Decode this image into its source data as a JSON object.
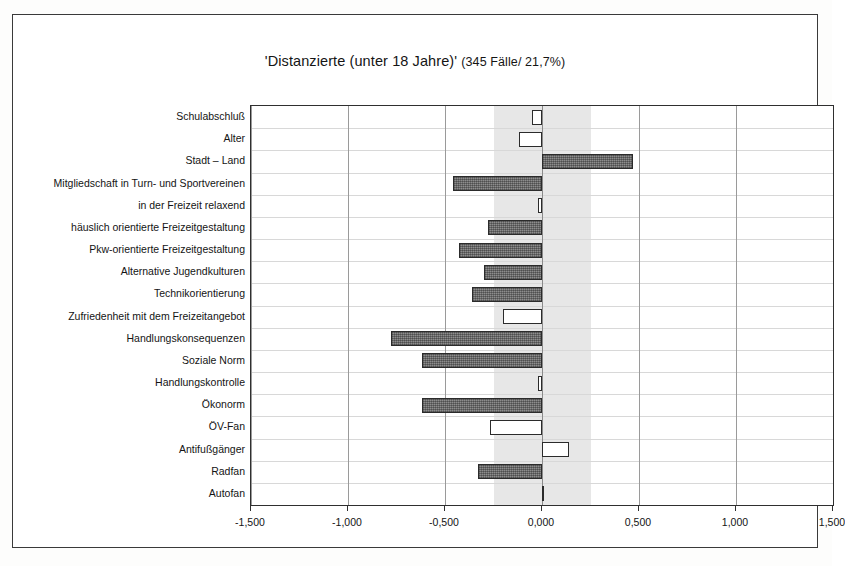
{
  "figure": {
    "title_main": "'Distanzierte (unter 18 Jahre)'",
    "title_sub": "(345 Fälle/ 21,7%)"
  },
  "axis": {
    "x_tick_labels": [
      "-1,500",
      "-1,000",
      "-0,500",
      "0,000",
      "0,500",
      "1,000",
      "1,500"
    ]
  },
  "chart_data": {
    "type": "bar",
    "orientation": "horizontal",
    "title": "'Distanzierte (unter 18 Jahre)' (345 Fälle/ 21,7%)",
    "xlabel": "",
    "ylabel": "",
    "xlim": [
      -1.5,
      1.5
    ],
    "xticks": [
      -1.5,
      -1.0,
      -0.5,
      0.0,
      0.5,
      1.0,
      1.5
    ],
    "xtick_labels": [
      "-1,500",
      "-1,000",
      "-0,500",
      "0,000",
      "0,500",
      "1,000",
      "1,500"
    ],
    "grid": true,
    "legend": null,
    "reference_band": {
      "from": -0.25,
      "to": 0.25,
      "color": "#e3e3e3",
      "description": "shaded neutral band"
    },
    "styles": {
      "filled": "#8d8d8d",
      "hollow": "#ffffff",
      "border": "#2b2b2b"
    },
    "categories": [
      "Schulabschluß",
      "Alter",
      "Stadt – Land",
      "Mitgliedschaft in Turn- und Sportvereinen",
      "in der Freizeit relaxend",
      "häuslich orientierte Freizeitgestaltung",
      "Pkw-orientierte Freizeitgestaltung",
      "Alternative Jugendkulturen",
      "Technikorientierung",
      "Zufriedenheit mit dem Freizeitangebot",
      "Handlungskonsequenzen",
      "Soziale Norm",
      "Handlungskontrolle",
      "Ökonorm",
      "ÖV-Fan",
      "Antifußgänger",
      "Radfan",
      "Autofan"
    ],
    "values": [
      -0.05,
      -0.12,
      0.47,
      -0.46,
      -0.02,
      -0.28,
      -0.43,
      -0.3,
      -0.36,
      -0.2,
      -0.78,
      -0.62,
      -0.02,
      -0.62,
      -0.27,
      0.14,
      -0.33,
      0.01
    ],
    "bar_styles": [
      "hollow",
      "hollow",
      "filled",
      "filled",
      "hollow",
      "filled",
      "filled",
      "filled",
      "filled",
      "hollow",
      "filled",
      "filled",
      "hollow",
      "filled",
      "hollow",
      "hollow",
      "filled",
      "filled"
    ]
  }
}
